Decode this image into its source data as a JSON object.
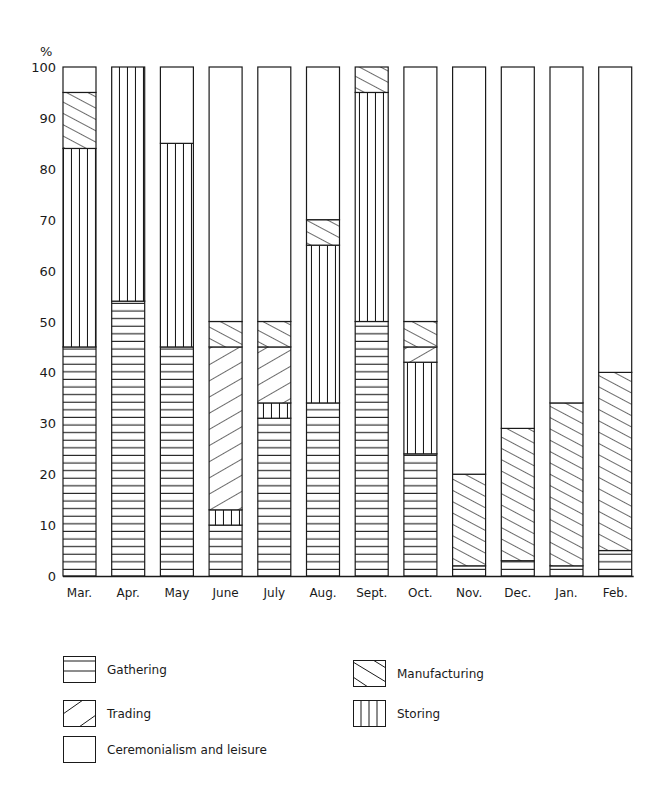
{
  "chart_data": {
    "type": "bar",
    "stacked": true,
    "percent": true,
    "title": "",
    "xlabel": "",
    "ylabel": "%",
    "ylim": [
      0,
      100
    ],
    "yticks": [
      0,
      10,
      20,
      30,
      40,
      50,
      60,
      70,
      80,
      90,
      100
    ],
    "grid": false,
    "legend_position": "bottom",
    "categories": [
      "Mar.",
      "Apr.",
      "May",
      "June",
      "July",
      "Aug.",
      "Sept.",
      "Oct.",
      "Nov.",
      "Dec.",
      "Jan.",
      "Feb."
    ],
    "series": [
      {
        "name": "Gathering",
        "pattern": "horizontal",
        "values": [
          45,
          54,
          45,
          10,
          31,
          34,
          50,
          24,
          2,
          3,
          2,
          5
        ]
      },
      {
        "name": "Storing",
        "pattern": "vertical",
        "values": [
          39,
          46,
          40,
          3,
          3,
          31,
          45,
          18,
          0,
          0,
          0,
          0
        ]
      },
      {
        "name": "Trading",
        "pattern": "diagonal-up",
        "values": [
          0,
          0,
          0,
          32,
          11,
          0,
          0,
          3,
          0,
          0,
          0,
          0
        ]
      },
      {
        "name": "Manufacturing",
        "pattern": "diagonal-down",
        "values": [
          11,
          0,
          0,
          5,
          5,
          5,
          5,
          5,
          18,
          26,
          32,
          35
        ]
      },
      {
        "name": "Ceremonialism and leisure",
        "pattern": "blank",
        "values": [
          5,
          0,
          15,
          50,
          50,
          30,
          0,
          50,
          80,
          71,
          66,
          60
        ]
      }
    ]
  },
  "axis": {
    "y_unit_label": "%"
  },
  "legend": {
    "items": [
      {
        "label": "Gathering",
        "pattern": "horizontal"
      },
      {
        "label": "Trading",
        "pattern": "diagonal-up"
      },
      {
        "label": "Ceremonialism and leisure",
        "pattern": "blank"
      },
      {
        "label": "Manufacturing",
        "pattern": "diagonal-down"
      },
      {
        "label": "Storing",
        "pattern": "vertical"
      }
    ]
  },
  "colors": {
    "ink": "#1a1a1a",
    "paper": "#ffffff"
  }
}
